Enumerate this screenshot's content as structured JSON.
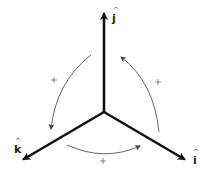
{
  "diagram": {
    "axes": [
      {
        "name": "j",
        "label": "j",
        "hat": "^",
        "direction": "up"
      },
      {
        "name": "i",
        "label": "i",
        "hat": "^",
        "direction": "down-right"
      },
      {
        "name": "k",
        "label": "k",
        "hat": "^",
        "direction": "down-left"
      }
    ],
    "arcs": [
      {
        "from": "j",
        "to": "k",
        "sign": "+"
      },
      {
        "from": "k",
        "to": "i",
        "sign": "+"
      },
      {
        "from": "i",
        "to": "j",
        "sign": "+"
      }
    ],
    "colors": {
      "axis": "#111111",
      "arc": "#555555",
      "background": "#ffffff"
    }
  }
}
